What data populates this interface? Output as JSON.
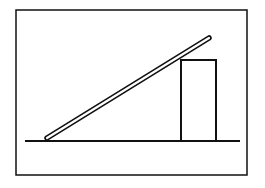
{
  "canvas": {
    "width": 265,
    "height": 188,
    "background": "#ffffff"
  },
  "colors": {
    "ink": "#111111",
    "rod_fill": "#ffffff"
  },
  "frame": {
    "x": 16,
    "y": 10,
    "width": 231,
    "height": 165,
    "stroke_width": 1.5
  },
  "ground_line": {
    "x1": 25,
    "y1": 141,
    "x2": 240,
    "y2": 141,
    "stroke_width": 2
  },
  "block": {
    "x": 181,
    "y": 60,
    "width": 35,
    "height": 81,
    "stroke_width": 2
  },
  "rod": {
    "x1": 47,
    "y1": 138,
    "x2": 209,
    "y2": 38,
    "outer_width": 5.5,
    "inner_width": 2.2
  },
  "labels": []
}
